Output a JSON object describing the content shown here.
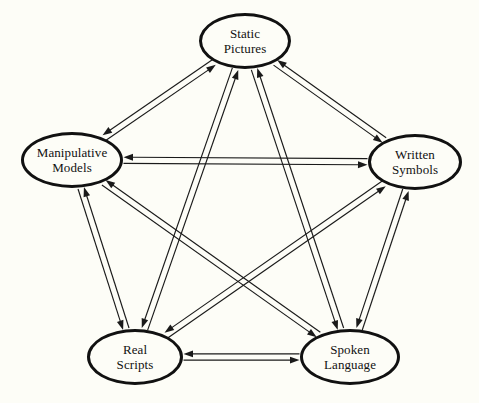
{
  "diagram": {
    "type": "complete-directed-graph",
    "background_color": "#fdfdf7",
    "line_color": "#1a1a1a",
    "node_border_color": "#111111",
    "node_fill_color": "#fdfdf7",
    "nodes": [
      {
        "id": "static-pictures",
        "label": "Static\nPictures",
        "cx": 245,
        "cy": 41,
        "rx": 46,
        "ry": 28
      },
      {
        "id": "manipulative-models",
        "label": "Manipulative\nModels",
        "cx": 72,
        "cy": 160,
        "rx": 51,
        "ry": 28
      },
      {
        "id": "written-symbols",
        "label": "Written\nSymbols",
        "cx": 415,
        "cy": 162,
        "rx": 47,
        "ry": 28
      },
      {
        "id": "real-scripts",
        "label": "Real\nScripts",
        "cx": 135,
        "cy": 357,
        "rx": 48,
        "ry": 28
      },
      {
        "id": "spoken-language",
        "label": "Spoken\nLanguage",
        "cx": 350,
        "cy": 357,
        "rx": 50,
        "ry": 28
      }
    ],
    "edges": [
      {
        "from": "static-pictures",
        "to": "manipulative-models",
        "bidirectional": true
      },
      {
        "from": "static-pictures",
        "to": "written-symbols",
        "bidirectional": true
      },
      {
        "from": "static-pictures",
        "to": "real-scripts",
        "bidirectional": true
      },
      {
        "from": "static-pictures",
        "to": "spoken-language",
        "bidirectional": true
      },
      {
        "from": "manipulative-models",
        "to": "written-symbols",
        "bidirectional": true
      },
      {
        "from": "manipulative-models",
        "to": "real-scripts",
        "bidirectional": true
      },
      {
        "from": "manipulative-models",
        "to": "spoken-language",
        "bidirectional": true
      },
      {
        "from": "written-symbols",
        "to": "real-scripts",
        "bidirectional": true
      },
      {
        "from": "written-symbols",
        "to": "spoken-language",
        "bidirectional": true
      },
      {
        "from": "real-scripts",
        "to": "spoken-language",
        "bidirectional": true
      }
    ]
  }
}
